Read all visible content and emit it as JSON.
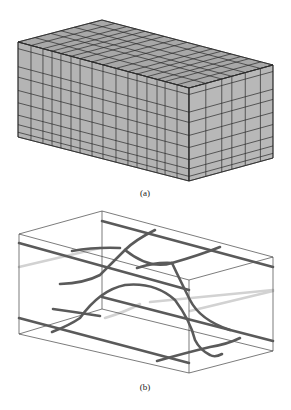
{
  "figure": {
    "panels": [
      {
        "id": "a",
        "label": "(a)",
        "description": "Hexahedral mesh of a rectangular box",
        "colors": {
          "front_face": "#b4b4b4",
          "right_face": "#b8b8b8",
          "top_face": "#a8a8a8",
          "grid_line": "#2a2a2a"
        },
        "corners": {
          "top_back_left": [
            18,
            42
          ],
          "top_back": [
            102,
            20
          ],
          "top_back_right": [
            273,
            65
          ],
          "top_front": [
            189,
            88
          ],
          "bottom_left": [
            18,
            137
          ],
          "bottom_front": [
            189,
            181
          ],
          "bottom_right": [
            273,
            158
          ]
        },
        "front_divisions_u": [
          0,
          0.076,
          0.146,
          0.199,
          0.251,
          0.31,
          0.363,
          0.433,
          0.497,
          0.573,
          0.643,
          0.696,
          0.754,
          0.813,
          0.86,
          0.93,
          1
        ],
        "right_divisions_u": [
          0,
          0.2,
          0.39,
          0.51,
          0.67,
          0.85,
          1
        ],
        "vertical_divisions_v": [
          0,
          0.07,
          0.26,
          0.37,
          0.51,
          0.64,
          0.77,
          0.87,
          0.95,
          1
        ]
      },
      {
        "id": "b",
        "label": "(b)",
        "description": "Wireframe box with embedded curved fracture/fiber lines",
        "colors": {
          "box_edge": "#444444",
          "dark_line": "#5a5a5a",
          "light_line": "#d2d2d2"
        }
      }
    ]
  }
}
